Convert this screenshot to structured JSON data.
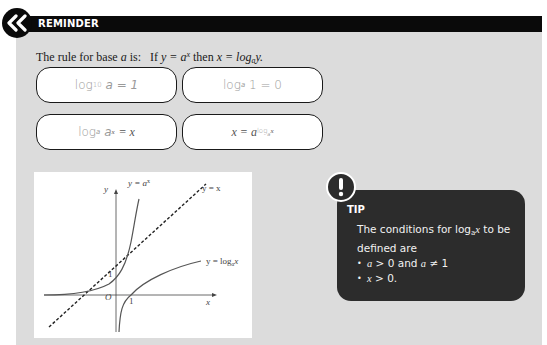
{
  "header": {
    "label": "REMINDER",
    "icon": "double-chevron-left-icon"
  },
  "rule": {
    "prefix": "The rule for base",
    "base_var": "a",
    "is": "is:",
    "if": "If",
    "equation1": "y = a",
    "exponent": "x",
    "then": "then",
    "equation2": "x = log",
    "log_base": "a",
    "log_arg": "y."
  },
  "formulas": [
    {
      "id": "log10-a",
      "text_main": "log",
      "sub": "10",
      "rest": "a = 1"
    },
    {
      "id": "loga-1",
      "text_main": "log",
      "sub": "a",
      "rest": "1 = 0"
    },
    {
      "id": "loga-ax",
      "text_main": "log",
      "sub": "a",
      "mid": "a",
      "sup": "x",
      "rest": "= x"
    },
    {
      "id": "x-equals",
      "lhs": "x = a",
      "sup": "log",
      "sup_sub": "a",
      "sup_tail": "x"
    }
  ],
  "graph": {
    "labels": {
      "y_axis": "y",
      "x_axis": "x",
      "origin": "O",
      "one_y": "1",
      "one_x": "1",
      "exp_curve": "y = a",
      "exp_sup": "x",
      "identity": "y = x",
      "log_curve": "y = log",
      "log_sub": "a",
      "log_tail": "x"
    }
  },
  "tip": {
    "title": "TIP",
    "icon": "exclamation-icon",
    "intro_1": "The conditions for log",
    "intro_sub": "a",
    "intro_x": "x",
    "intro_2": "to be defined are",
    "bullets": [
      {
        "a": "a",
        "gt": "> 0 and",
        "a2": "a",
        "ne": "≠ 1"
      },
      {
        "x": "x",
        "gt": "> 0."
      }
    ]
  }
}
